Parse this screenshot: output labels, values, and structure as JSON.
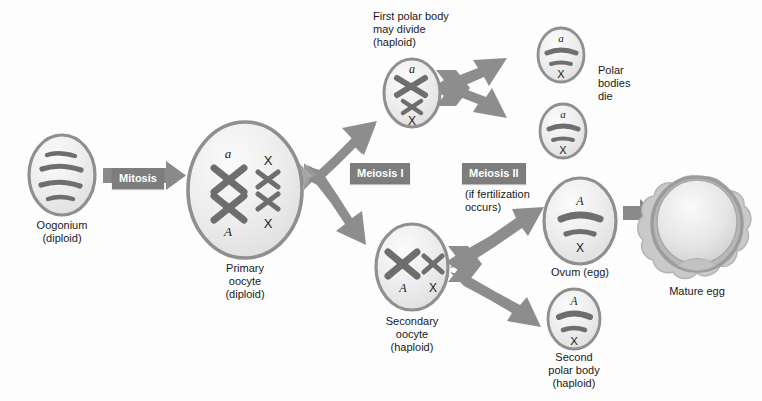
{
  "diagram": {
    "type": "biological-process-flowchart",
    "background_color": "#fdfdfd",
    "accent_gray": "#7d7d7d",
    "cell_outline_color": "#8f8f8f",
    "chromosome_color": "#6e6e6e"
  },
  "tags": {
    "mitosis": "Mitosis",
    "meiosis_1": "Meiosis I",
    "meiosis_2": "Meiosis II"
  },
  "notes": {
    "fertilization": "(if fertilization\noccurs)",
    "first_polar_body": "First polar body\nmay divide\n(haploid)",
    "polar_bodies_die": "Polar\nbodies\ndie"
  },
  "cells": [
    {
      "id": "oogonium",
      "name": "oogonium",
      "caption": "Oogonium\n(diploid)",
      "chromosome_labels": [],
      "chromosome_style": "four-bars",
      "ploidy": "diploid"
    },
    {
      "id": "primary-oocyte",
      "name": "primary-oocyte",
      "caption": "Primary\noocyte\n(diploid)",
      "chromosome_labels": [
        "a",
        "X",
        "A",
        "X"
      ],
      "chromosome_style": "four-x-shapes",
      "ploidy": "diploid"
    },
    {
      "id": "first-polar-body",
      "name": "first-polar-body",
      "caption": "",
      "chromosome_labels": [
        "a",
        "X"
      ],
      "chromosome_style": "two-x-shapes-stacked",
      "ploidy": "haploid"
    },
    {
      "id": "secondary-oocyte",
      "name": "secondary-oocyte",
      "caption": "Secondary\noocyte\n(haploid)",
      "chromosome_labels": [
        "A",
        "X"
      ],
      "chromosome_style": "two-x-shapes-side",
      "ploidy": "haploid"
    },
    {
      "id": "polar-body-upper",
      "name": "polar-body-upper",
      "caption": "",
      "chromosome_labels": [
        "a",
        "X"
      ],
      "chromosome_style": "two-bars",
      "ploidy": "haploid"
    },
    {
      "id": "polar-body-lower",
      "name": "polar-body-lower",
      "caption": "",
      "chromosome_labels": [
        "a",
        "X"
      ],
      "chromosome_style": "two-bars",
      "ploidy": "haploid"
    },
    {
      "id": "ovum",
      "name": "ovum",
      "caption": "Ovum (egg)",
      "chromosome_labels": [
        "A",
        "X"
      ],
      "chromosome_style": "two-bars",
      "ploidy": "haploid"
    },
    {
      "id": "second-polar-body",
      "name": "second-polar-body",
      "caption": "Second\npolar body\n(haploid)",
      "chromosome_labels": [
        "A",
        "X"
      ],
      "chromosome_style": "two-bars",
      "ploidy": "haploid"
    },
    {
      "id": "mature-egg",
      "name": "mature-egg",
      "caption": "Mature egg",
      "chromosome_labels": [],
      "chromosome_style": "none",
      "ploidy": ""
    }
  ],
  "chromosome_glyph_labels": {
    "oocyte_a": "a",
    "oocyte_A": "A",
    "oocyte_X_top": "X",
    "oocyte_X_bottom": "X",
    "fpb_a": "a",
    "fpb_X": "X",
    "soc_A": "A",
    "soc_X": "X",
    "pb1_a": "a",
    "pb1_X": "X",
    "pb2_a": "a",
    "pb2_X": "X",
    "ovum_A": "A",
    "ovum_X": "X",
    "spb_A": "A",
    "spb_X": "X"
  }
}
